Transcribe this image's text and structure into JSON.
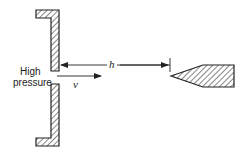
{
  "diagram": {
    "type": "fluid-flow-schematic",
    "labels": {
      "pressure_line1": "High",
      "pressure_line2": "pressure",
      "distance": "h",
      "velocity": "v"
    },
    "colors": {
      "stroke": "#222222",
      "background": "#ffffff"
    },
    "components": [
      {
        "id": "upper-wall",
        "description": "L-shaped hatched wall (upper)"
      },
      {
        "id": "lower-wall",
        "description": "L-shaped hatched wall (lower)"
      },
      {
        "id": "needle-probe",
        "description": "Hatched conical needle pointing toward orifice"
      },
      {
        "id": "h-dimension-arrow",
        "description": "Distance h from orifice to needle tip"
      },
      {
        "id": "v-velocity-arrow",
        "description": "Flow velocity v direction"
      }
    ]
  }
}
